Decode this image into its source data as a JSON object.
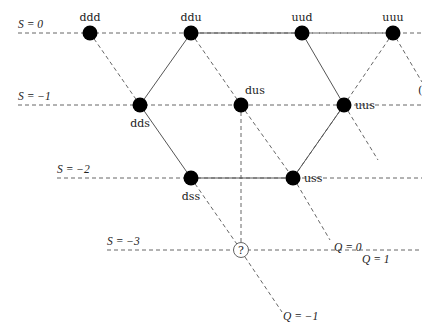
{
  "figure": {
    "type": "baryon-decuplet-weight-diagram",
    "strangeness_lines": [
      {
        "label": "S = 0",
        "y": 33,
        "x_start": 18
      },
      {
        "label": "S = −1",
        "y": 105,
        "x_start": 18
      },
      {
        "label": "S = −2",
        "y": 178,
        "x_start": 57
      },
      {
        "label": "S = −3",
        "y": 250,
        "x_start": 107
      }
    ],
    "charge_labels": [
      {
        "label": "Q = 1",
        "x": 362,
        "y": 263
      },
      {
        "label": "Q = 0",
        "x": 334,
        "y": 251
      },
      {
        "label": "Q = −1",
        "x": 283,
        "y": 320
      }
    ],
    "nodes": [
      {
        "id": "ddd",
        "label": "ddd",
        "x": 90,
        "y": 33,
        "label_pos": "above"
      },
      {
        "id": "ddu",
        "label": "ddu",
        "x": 191,
        "y": 33,
        "label_pos": "above"
      },
      {
        "id": "uud",
        "label": "uud",
        "x": 302,
        "y": 33,
        "label_pos": "above"
      },
      {
        "id": "uuu",
        "label": "uuu",
        "x": 393,
        "y": 33,
        "label_pos": "above"
      },
      {
        "id": "dds",
        "label": "dds",
        "x": 140,
        "y": 105,
        "label_pos": "below"
      },
      {
        "id": "dus",
        "label": "dus",
        "x": 241,
        "y": 105,
        "label_pos": "above-right"
      },
      {
        "id": "uus",
        "label": "uus",
        "x": 344,
        "y": 105,
        "label_pos": "right"
      },
      {
        "id": "dss",
        "label": "dss",
        "x": 191,
        "y": 178,
        "label_pos": "below"
      },
      {
        "id": "uss",
        "label": "uss",
        "x": 293,
        "y": 178,
        "label_pos": "right"
      },
      {
        "id": "unknown",
        "label": "?",
        "x": 241,
        "y": 250,
        "label_pos": "center",
        "open": true
      }
    ],
    "solid_edges": [
      [
        "ddu",
        "dds"
      ],
      [
        "ddu",
        "uud"
      ],
      [
        "uud",
        "uus"
      ],
      [
        "dds",
        "dss"
      ],
      [
        "dss",
        "uss"
      ],
      [
        "uss",
        "uus"
      ]
    ],
    "dashed_edges": [
      [
        "ddd",
        "dds"
      ],
      [
        "ddu",
        "dus"
      ],
      [
        "dus",
        "uss"
      ],
      [
        "dss",
        "unknown"
      ],
      [
        "dus",
        "unknown"
      ],
      [
        "uus",
        "uss"
      ],
      [
        "uuu",
        "uus"
      ],
      [
        "uud",
        "uuu"
      ]
    ],
    "partial_right_label": "("
  }
}
